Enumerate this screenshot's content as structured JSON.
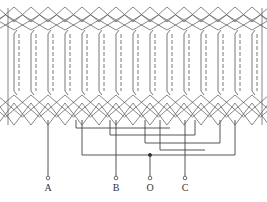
{
  "diagram": {
    "type": "stator-winding-diagram",
    "slot_count": 15,
    "slot_x": [
      14,
      31,
      48,
      65,
      82,
      99,
      116,
      133,
      150,
      167,
      184,
      201,
      218,
      235,
      252
    ],
    "coil_top_y": 30,
    "coil_bottom_y": 95,
    "end_top_y": 5,
    "end_bottom_y": 125,
    "line_color": "#444444",
    "terminals": [
      {
        "id": "A",
        "label": "A",
        "x": 48
      },
      {
        "id": "B",
        "label": "B",
        "x": 116
      },
      {
        "id": "O",
        "label": "O",
        "x": 150
      },
      {
        "id": "C",
        "label": "C",
        "x": 185
      }
    ],
    "terminal_y": 178,
    "label_y": 191,
    "neutral_junction": {
      "x": 150,
      "y": 155
    }
  }
}
